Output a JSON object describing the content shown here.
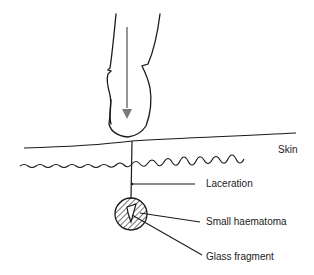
{
  "diagram": {
    "labels": {
      "skin": "Skin",
      "laceration": "Laceration",
      "haematoma": "Small haematoma",
      "fragment": "Glass fragment"
    },
    "colors": {
      "line": "#1a1a1a",
      "arrow": "#7a7a7a",
      "text": "#222222"
    }
  }
}
